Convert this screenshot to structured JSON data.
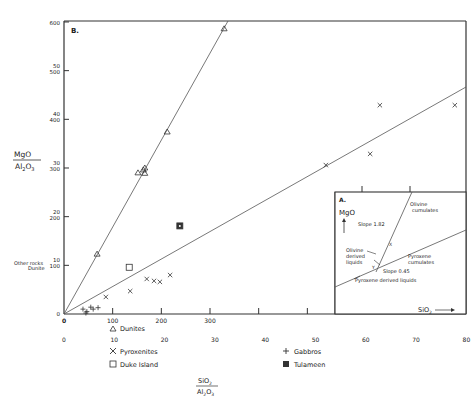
{
  "chart_data": {
    "type": "scatter",
    "panel_label": "B.",
    "ylabel": {
      "num": "MgO",
      "den": "Al2O3"
    },
    "xlabel": {
      "num": "SiO2",
      "den": "Al2O3"
    },
    "y_ticks_outer": [
      0,
      100,
      200,
      300,
      400,
      500,
      600
    ],
    "y_ticks_inner": [
      10,
      20,
      30,
      40,
      50
    ],
    "y_side_labels": [
      "Other rocks",
      "Dunite"
    ],
    "x_ticks_upper": [
      0,
      100,
      200,
      300
    ],
    "x_ticks_lower": [
      0,
      10,
      20,
      30,
      40,
      50,
      60,
      70,
      80
    ],
    "ylim": [
      0,
      600
    ],
    "xlim": [
      0,
      825
    ],
    "series": [
      {
        "name": "Dunites",
        "marker": "triangle",
        "points": [
          [
            68,
            123
          ],
          [
            152,
            290
          ],
          [
            163,
            296
          ],
          [
            166,
            289
          ],
          [
            166,
            300
          ],
          [
            212,
            374
          ],
          [
            329,
            586
          ]
        ]
      },
      {
        "name": "Pyroxenites",
        "marker": "x",
        "points": [
          [
            86,
            35
          ],
          [
            136,
            47
          ],
          [
            170,
            72
          ],
          [
            185,
            68
          ],
          [
            197,
            66
          ],
          [
            218,
            80
          ],
          [
            538,
            306
          ],
          [
            629,
            329
          ],
          [
            649,
            429
          ],
          [
            803,
            429
          ]
        ]
      },
      {
        "name": "Gabbros",
        "marker": "plus",
        "points": [
          [
            39,
            10
          ],
          [
            47,
            5
          ],
          [
            55,
            14
          ],
          [
            60,
            10
          ],
          [
            70,
            13
          ],
          [
            45,
            2
          ]
        ]
      },
      {
        "name": "Duke Island",
        "marker": "square",
        "points": [
          [
            134,
            96
          ]
        ]
      },
      {
        "name": "Tulameen",
        "marker": "filled-square",
        "points": [
          [
            238,
            181
          ]
        ]
      }
    ],
    "fit_lines": [
      {
        "name": "Dunite trend",
        "slope_label": "1.82",
        "from": [
          0,
          0
        ],
        "to": [
          335,
          600
        ]
      },
      {
        "name": "Pyroxenite trend",
        "slope_label": "0.45",
        "from": [
          0,
          0
        ],
        "to": [
          826,
          465
        ]
      }
    ],
    "legend": [
      {
        "label": "Dunites",
        "marker": "triangle"
      },
      {
        "label": "Pyroxenites",
        "marker": "x"
      },
      {
        "label": "Gabbros",
        "marker": "plus"
      },
      {
        "label": "Duke Island",
        "marker": "square"
      },
      {
        "label": "Tulameen",
        "marker": "filled-square"
      }
    ],
    "inset": {
      "label": "A.",
      "y_axis": "MgO",
      "x_axis": "SiO2",
      "annotations": [
        "Olivine cumulates",
        "Slope 1.82",
        "Olivine derived liquids",
        "Pyroxene cumulates",
        "Slope 0.45",
        "Pyroxene derived liquids"
      ],
      "point_labels": [
        "X",
        "Y"
      ]
    }
  },
  "labels": {
    "panel": "B.",
    "mgo": "MgO",
    "al2o3": "Al",
    "al_sub": "2",
    "o3": "O",
    "o_sub": "3",
    "sio": "SiO",
    "si_sub": "2",
    "other_rocks": "Other rocks",
    "dunite": "Dunite",
    "legend_dunites": "Dunites",
    "legend_pyroxenites": "Pyroxenites",
    "legend_gabbros": "Gabbros",
    "legend_duke": "Duke Island",
    "legend_tulameen": "Tulameen",
    "inset_label": "A.",
    "inset_mgo": "MgO",
    "inset_sio2": "SiO",
    "inset_olivine_cum_1": "Olivine",
    "inset_olivine_cum_2": "cumulates",
    "inset_slope1": "Slope  1.82",
    "inset_oliv_liq_1": "Olivine",
    "inset_oliv_liq_2": "derived",
    "inset_oliv_liq_3": "liquids",
    "inset_pyx_cum_1": "Pyroxene",
    "inset_pyx_cum_2": "cumulates",
    "inset_slope2": "Slope 0.45",
    "inset_pyx_liq": "Pyroxene derived liquids",
    "inset_x": "X",
    "inset_y": "Y"
  }
}
